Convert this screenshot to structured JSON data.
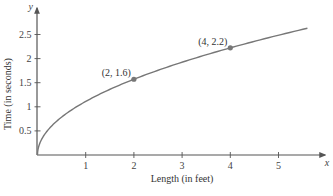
{
  "chart_data": {
    "type": "line",
    "title": "",
    "xlabel": "Length (in feet)",
    "ylabel": "Time (in seconds)",
    "x_var": "x",
    "y_var": "y",
    "xlim": [
      0,
      5.8
    ],
    "ylim": [
      0,
      2.8
    ],
    "x_ticks": [
      1,
      2,
      3,
      4,
      5
    ],
    "x_tick_labels": [
      "1",
      "2",
      "3",
      "4",
      "5"
    ],
    "y_ticks": [
      0.5,
      1,
      1.5,
      2,
      2.5
    ],
    "y_tick_labels": [
      "0.5",
      "1",
      "1.5",
      "2",
      "2.5"
    ],
    "grid": false,
    "legend": null,
    "series": [
      {
        "name": "time vs length",
        "x": [
          0,
          0.05,
          0.25,
          0.5,
          1,
          1.5,
          2,
          2.5,
          3,
          3.5,
          4,
          4.5,
          5,
          5.6
        ],
        "y": [
          0,
          0.25,
          0.56,
          0.79,
          1.11,
          1.36,
          1.57,
          1.76,
          1.92,
          2.08,
          2.22,
          2.36,
          2.48,
          2.63
        ],
        "color": "#777777"
      }
    ],
    "highlighted_points": [
      {
        "x": 2,
        "y": 1.6,
        "label": "(2, 1.6)"
      },
      {
        "x": 4,
        "y": 2.2,
        "label": "(4, 2.2)"
      }
    ]
  },
  "colors": {
    "axis": "#555555",
    "curve": "#777777",
    "point": "#777777",
    "text": "#333333"
  }
}
